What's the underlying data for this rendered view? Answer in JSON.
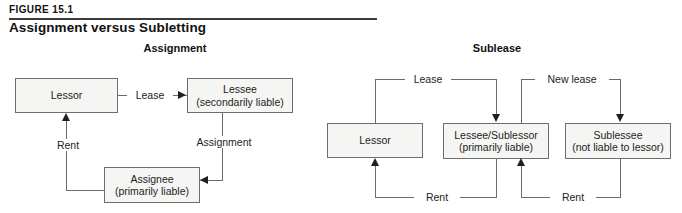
{
  "figure": {
    "number": "FIGURE 15.1",
    "title": "Assignment versus Subletting"
  },
  "panels": [
    {
      "id": "assignment",
      "title": "Assignment",
      "nodes": [
        {
          "id": "lessor",
          "line1": "Lessor",
          "line2": ""
        },
        {
          "id": "lessee",
          "line1": "Lessee",
          "line2": "(secondarily liable)"
        },
        {
          "id": "assignee",
          "line1": "Assignee",
          "line2": "(primarily liable)"
        }
      ],
      "edges": [
        {
          "id": "lease",
          "label": "Lease",
          "from": "lessor",
          "to": "lessee"
        },
        {
          "id": "assignment",
          "label": "Assignment",
          "from": "lessee",
          "to": "assignee"
        },
        {
          "id": "rent",
          "label": "Rent",
          "from": "assignee",
          "to": "lessor"
        }
      ]
    },
    {
      "id": "sublease",
      "title": "Sublease",
      "nodes": [
        {
          "id": "lessor2",
          "line1": "Lessor",
          "line2": ""
        },
        {
          "id": "sublessor",
          "line1": "Lessee/Sublessor",
          "line2": "(primarily liable)"
        },
        {
          "id": "sublessee",
          "line1": "Sublessee",
          "line2": "(not liable to lessor)"
        }
      ],
      "edges": [
        {
          "id": "lease2",
          "label": "Lease",
          "from": "lessor2",
          "to": "sublessor"
        },
        {
          "id": "rent2",
          "label": "Rent",
          "from": "sublessor",
          "to": "lessor2"
        },
        {
          "id": "new-lease",
          "label": "New lease",
          "from": "sublessor",
          "to": "sublessee"
        },
        {
          "id": "rent3",
          "label": "Rent",
          "from": "sublessee",
          "to": "sublessor"
        }
      ]
    }
  ]
}
